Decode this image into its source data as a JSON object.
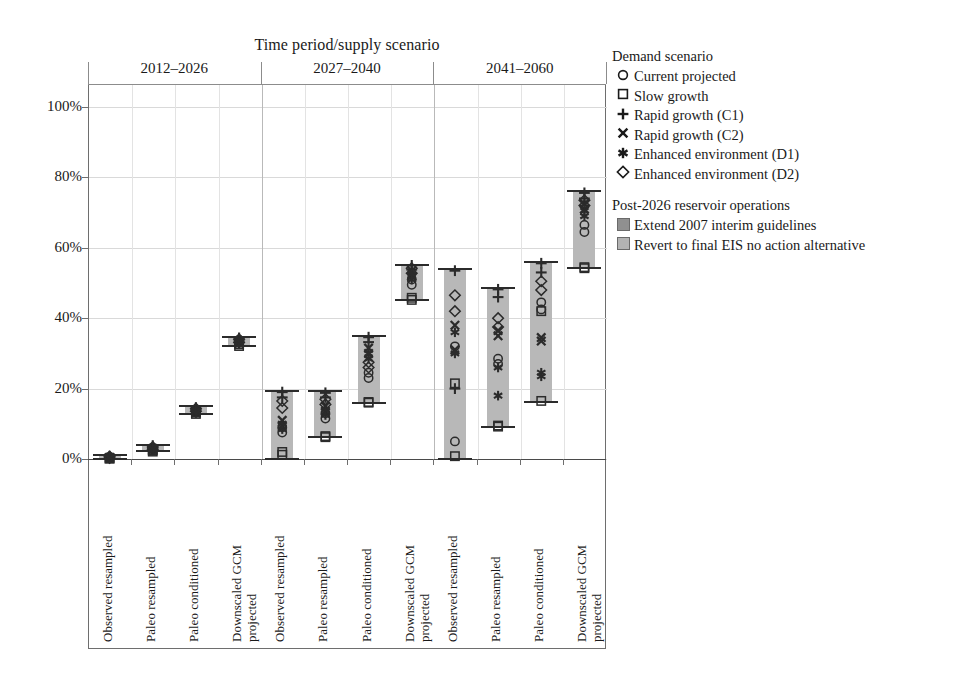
{
  "chart_data": {
    "type": "bar",
    "title": "Time period/supply scenario",
    "xlabel": "",
    "ylabel": "",
    "ylim": [
      0,
      105
    ],
    "ytick_labels": [
      "0%",
      "20%",
      "40%",
      "60%",
      "80%",
      "100%"
    ],
    "ytick_values": [
      0,
      20,
      40,
      60,
      80,
      100
    ],
    "grid": true,
    "legend_position": "right",
    "group_labels": [
      "2012–2026",
      "2027–2040",
      "2041–2060"
    ],
    "categories": [
      "Observed resampled",
      "Paleo resampled",
      "Paleo conditioned",
      "Downscaled GCM projected"
    ],
    "series": [
      {
        "name": "Extend 2007 interim guidelines",
        "color": "#b8b8b8"
      },
      {
        "name": "Revert to final EIS no action alternative",
        "color": "#cfcfcf"
      }
    ],
    "columns": [
      {
        "group": "2012–2026",
        "category": "Observed resampled",
        "extend_range": [
          0,
          1
        ],
        "revert_range": [
          0,
          0.5
        ],
        "markers_extend": [
          {
            "shape": "circle",
            "value": 0.6
          },
          {
            "shape": "square",
            "value": 0.2
          },
          {
            "shape": "plus",
            "value": 0.8
          },
          {
            "shape": "cross",
            "value": 0.5
          },
          {
            "shape": "asterisk",
            "value": 0.4
          },
          {
            "shape": "diamond",
            "value": 0.7
          }
        ],
        "markers_revert": [
          {
            "shape": "circle",
            "value": 0.3
          },
          {
            "shape": "square",
            "value": 0.1
          },
          {
            "shape": "plus",
            "value": 0.4
          },
          {
            "shape": "cross",
            "value": 0.2
          },
          {
            "shape": "asterisk",
            "value": 0.2
          },
          {
            "shape": "diamond",
            "value": 0.3
          }
        ]
      },
      {
        "group": "2012–2026",
        "category": "Paleo resampled",
        "extend_range": [
          2.2,
          4.0
        ],
        "revert_range": [
          2.0,
          3.4
        ],
        "markers_extend": [
          {
            "shape": "circle",
            "value": 3.2
          },
          {
            "shape": "square",
            "value": 2.5
          },
          {
            "shape": "plus",
            "value": 3.8
          },
          {
            "shape": "cross",
            "value": 3.0
          },
          {
            "shape": "asterisk",
            "value": 2.9
          },
          {
            "shape": "diamond",
            "value": 3.4
          }
        ],
        "markers_revert": [
          {
            "shape": "circle",
            "value": 2.7
          },
          {
            "shape": "square",
            "value": 2.1
          },
          {
            "shape": "plus",
            "value": 3.1
          },
          {
            "shape": "cross",
            "value": 2.6
          },
          {
            "shape": "asterisk",
            "value": 2.5
          },
          {
            "shape": "diamond",
            "value": 2.8
          }
        ]
      },
      {
        "group": "2012–2026",
        "category": "Paleo conditioned",
        "extend_range": [
          12.8,
          15.0
        ],
        "revert_range": [
          12.5,
          14.2
        ],
        "markers_extend": [
          {
            "shape": "circle",
            "value": 14.1
          },
          {
            "shape": "square",
            "value": 13.2
          },
          {
            "shape": "plus",
            "value": 14.6
          },
          {
            "shape": "cross",
            "value": 13.9
          },
          {
            "shape": "asterisk",
            "value": 13.7
          },
          {
            "shape": "diamond",
            "value": 14.3
          }
        ],
        "markers_revert": [
          {
            "shape": "circle",
            "value": 13.5
          },
          {
            "shape": "square",
            "value": 12.8
          },
          {
            "shape": "plus",
            "value": 14.0
          },
          {
            "shape": "cross",
            "value": 13.3
          },
          {
            "shape": "asterisk",
            "value": 13.1
          },
          {
            "shape": "diamond",
            "value": 13.6
          }
        ]
      },
      {
        "group": "2012–2026",
        "category": "Downscaled GCM projected",
        "extend_range": [
          32.2,
          34.8
        ],
        "revert_range": [
          31.8,
          33.8
        ],
        "markers_extend": [
          {
            "shape": "circle",
            "value": 33.8
          },
          {
            "shape": "square",
            "value": 32.6
          },
          {
            "shape": "plus",
            "value": 34.4
          },
          {
            "shape": "cross",
            "value": 33.5
          },
          {
            "shape": "asterisk",
            "value": 33.3
          },
          {
            "shape": "diamond",
            "value": 34.0
          }
        ],
        "markers_revert": [
          {
            "shape": "circle",
            "value": 33.0
          },
          {
            "shape": "square",
            "value": 32.1
          },
          {
            "shape": "plus",
            "value": 33.5
          },
          {
            "shape": "cross",
            "value": 32.8
          },
          {
            "shape": "asterisk",
            "value": 32.6
          },
          {
            "shape": "diamond",
            "value": 33.1
          }
        ]
      },
      {
        "group": "2027–2040",
        "category": "Observed resampled",
        "extend_range": [
          0,
          19.2
        ],
        "revert_range": [
          0,
          18.2
        ],
        "markers_extend": [
          {
            "shape": "circle",
            "value": 9.0
          },
          {
            "shape": "square",
            "value": 2.0
          },
          {
            "shape": "plus",
            "value": 19.0
          },
          {
            "shape": "cross",
            "value": 11.0
          },
          {
            "shape": "asterisk",
            "value": 10.0
          },
          {
            "shape": "diamond",
            "value": 16.5
          }
        ],
        "markers_revert": [
          {
            "shape": "circle",
            "value": 7.5
          },
          {
            "shape": "square",
            "value": 1.2
          },
          {
            "shape": "plus",
            "value": 17.5
          },
          {
            "shape": "cross",
            "value": 9.5
          },
          {
            "shape": "asterisk",
            "value": 8.5
          },
          {
            "shape": "diamond",
            "value": 14.5
          }
        ]
      },
      {
        "group": "2027–2040",
        "category": "Paleo resampled",
        "extend_range": [
          6.2,
          19.2
        ],
        "revert_range": [
          6.0,
          18.5
        ],
        "markers_extend": [
          {
            "shape": "circle",
            "value": 13.0
          },
          {
            "shape": "square",
            "value": 6.5
          },
          {
            "shape": "plus",
            "value": 18.8
          },
          {
            "shape": "cross",
            "value": 15.0
          },
          {
            "shape": "asterisk",
            "value": 14.0
          },
          {
            "shape": "diamond",
            "value": 17.0
          }
        ],
        "markers_revert": [
          {
            "shape": "circle",
            "value": 11.5
          },
          {
            "shape": "square",
            "value": 6.2
          },
          {
            "shape": "plus",
            "value": 17.5
          },
          {
            "shape": "cross",
            "value": 13.5
          },
          {
            "shape": "asterisk",
            "value": 12.5
          },
          {
            "shape": "diamond",
            "value": 15.5
          }
        ]
      },
      {
        "group": "2027–2040",
        "category": "Paleo conditioned",
        "extend_range": [
          16.0,
          35.0
        ],
        "revert_range": [
          15.8,
          33.5
        ],
        "markers_extend": [
          {
            "shape": "circle",
            "value": 24.5
          },
          {
            "shape": "square",
            "value": 16.2
          },
          {
            "shape": "plus",
            "value": 34.6
          },
          {
            "shape": "cross",
            "value": 31.5
          },
          {
            "shape": "asterisk",
            "value": 30.0
          },
          {
            "shape": "diamond",
            "value": 27.5
          }
        ],
        "markers_revert": [
          {
            "shape": "circle",
            "value": 23.0
          },
          {
            "shape": "square",
            "value": 16.0
          },
          {
            "shape": "plus",
            "value": 33.2
          },
          {
            "shape": "cross",
            "value": 30.0
          },
          {
            "shape": "asterisk",
            "value": 28.5
          },
          {
            "shape": "diamond",
            "value": 26.0
          }
        ]
      },
      {
        "group": "2027–2040",
        "category": "Downscaled GCM projected",
        "extend_range": [
          45.2,
          55.2
        ],
        "revert_range": [
          45.0,
          54.0
        ],
        "markers_extend": [
          {
            "shape": "circle",
            "value": 51.0
          },
          {
            "shape": "square",
            "value": 45.8
          },
          {
            "shape": "plus",
            "value": 55.0
          },
          {
            "shape": "cross",
            "value": 53.5
          },
          {
            "shape": "asterisk",
            "value": 52.5
          },
          {
            "shape": "diamond",
            "value": 54.2
          }
        ],
        "markers_revert": [
          {
            "shape": "circle",
            "value": 49.5
          },
          {
            "shape": "square",
            "value": 45.2
          },
          {
            "shape": "plus",
            "value": 53.8
          },
          {
            "shape": "cross",
            "value": 52.0
          },
          {
            "shape": "asterisk",
            "value": 51.0
          },
          {
            "shape": "diamond",
            "value": 52.8
          }
        ]
      },
      {
        "group": "2041–2060",
        "category": "Observed resampled",
        "extend_range": [
          0,
          54.0
        ],
        "revert_range": [
          0,
          50.5
        ],
        "markers_extend": [
          {
            "shape": "circle",
            "value": 5.0
          },
          {
            "shape": "square",
            "value": 0.8
          },
          {
            "shape": "plus",
            "value": 53.5
          },
          {
            "shape": "cross",
            "value": 38.0
          },
          {
            "shape": "asterisk",
            "value": 36.0
          },
          {
            "shape": "diamond",
            "value": 46.5
          }
        ],
        "markers_revert": [
          {
            "shape": "circle",
            "value": 32.0
          },
          {
            "shape": "square",
            "value": 21.5
          },
          {
            "shape": "plus",
            "value": 20.0
          },
          {
            "shape": "cross",
            "value": 31.0
          },
          {
            "shape": "asterisk",
            "value": 30.0
          },
          {
            "shape": "diamond",
            "value": 42.0
          }
        ]
      },
      {
        "group": "2041–2060",
        "category": "Paleo resampled",
        "extend_range": [
          9.2,
          48.6
        ],
        "revert_range": [
          9.0,
          46.0
        ],
        "markers_extend": [
          {
            "shape": "circle",
            "value": 28.5
          },
          {
            "shape": "square",
            "value": 9.5
          },
          {
            "shape": "plus",
            "value": 48.2
          },
          {
            "shape": "cross",
            "value": 36.5
          },
          {
            "shape": "asterisk",
            "value": 18.0
          },
          {
            "shape": "diamond",
            "value": 40.0
          }
        ],
        "markers_revert": [
          {
            "shape": "circle",
            "value": 27.0
          },
          {
            "shape": "square",
            "value": 9.2
          },
          {
            "shape": "plus",
            "value": 46.0
          },
          {
            "shape": "cross",
            "value": 35.0
          },
          {
            "shape": "asterisk",
            "value": 26.0
          },
          {
            "shape": "diamond",
            "value": 37.5
          }
        ]
      },
      {
        "group": "2041–2060",
        "category": "Paleo conditioned",
        "extend_range": [
          16.2,
          56.0
        ],
        "revert_range": [
          16.0,
          53.5
        ],
        "markers_extend": [
          {
            "shape": "circle",
            "value": 44.5
          },
          {
            "shape": "square",
            "value": 16.5
          },
          {
            "shape": "plus",
            "value": 55.6
          },
          {
            "shape": "cross",
            "value": 34.5
          },
          {
            "shape": "asterisk",
            "value": 24.5
          },
          {
            "shape": "diamond",
            "value": 50.5
          }
        ],
        "markers_revert": [
          {
            "shape": "circle",
            "value": 42.5
          },
          {
            "shape": "square",
            "value": 42.0
          },
          {
            "shape": "plus",
            "value": 53.0
          },
          {
            "shape": "cross",
            "value": 33.5
          },
          {
            "shape": "asterisk",
            "value": 23.5
          },
          {
            "shape": "diamond",
            "value": 48.0
          }
        ]
      },
      {
        "group": "2041–2060",
        "category": "Downscaled GCM projected",
        "extend_range": [
          54.2,
          76.0
        ],
        "revert_range": [
          54.0,
          74.0
        ],
        "markers_extend": [
          {
            "shape": "circle",
            "value": 66.5
          },
          {
            "shape": "square",
            "value": 54.5
          },
          {
            "shape": "plus",
            "value": 75.6
          },
          {
            "shape": "cross",
            "value": 72.5
          },
          {
            "shape": "asterisk",
            "value": 70.5
          },
          {
            "shape": "diamond",
            "value": 73.5
          }
        ],
        "markers_revert": [
          {
            "shape": "circle",
            "value": 64.5
          },
          {
            "shape": "square",
            "value": 54.2
          },
          {
            "shape": "plus",
            "value": 74.0
          },
          {
            "shape": "cross",
            "value": 71.0
          },
          {
            "shape": "asterisk",
            "value": 69.0
          },
          {
            "shape": "diamond",
            "value": 72.0
          }
        ]
      }
    ]
  },
  "legend": {
    "demand_title": "Demand scenario",
    "demand_items": [
      {
        "symbol": "circle",
        "label": "Current projected"
      },
      {
        "symbol": "square",
        "label": "Slow growth"
      },
      {
        "symbol": "plus",
        "label": "Rapid growth (C1)"
      },
      {
        "symbol": "cross",
        "label": "Rapid growth (C2)"
      },
      {
        "symbol": "asterisk",
        "label": "Enhanced environment (D1)"
      },
      {
        "symbol": "diamond",
        "label": "Enhanced environment (D2)"
      }
    ],
    "ops_title": "Post-2026 reservoir operations",
    "ops_items": [
      {
        "swatch": "#909090",
        "label": "Extend 2007 interim guidelines"
      },
      {
        "swatch": "#b3b3b3",
        "label": "Revert to final EIS no action alternative"
      }
    ]
  }
}
